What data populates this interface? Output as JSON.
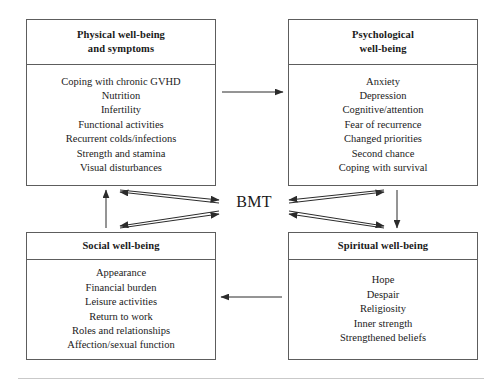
{
  "figure": {
    "hub_label": "BMT",
    "boxes": [
      {
        "id": "physical",
        "title_line1": "Physical well-being",
        "title_line2": "and symptoms",
        "items": [
          "Coping with chronic GVHD",
          "Nutrition",
          "Infertility",
          "Functional activities",
          "Recurrent colds/infections",
          "Strength and stamina",
          "Visual disturbances"
        ]
      },
      {
        "id": "psychological",
        "title_line1": "Psychological",
        "title_line2": "well-being",
        "items": [
          "Anxiety",
          "Depression",
          "Cognitive/attention",
          "Fear of recurrence",
          "Changed priorities",
          "Second chance",
          "Coping with survival"
        ]
      },
      {
        "id": "social",
        "title_line1": "Social well-being",
        "items": [
          "Appearance",
          "Financial burden",
          "Leisure activities",
          "Return to work",
          "Roles and relationships",
          "Affection/sexual function"
        ]
      },
      {
        "id": "spiritual",
        "title_line1": "Spiritual well-being",
        "items": [
          "Hope",
          "Despair",
          "Religiosity",
          "Inner strength",
          "Strengthened beliefs"
        ]
      }
    ],
    "colors": {
      "box_border": "#5d5d5d",
      "arrow": "#2b2b2b",
      "text": "#1a1a1a",
      "rule": "#c9c9c9",
      "background": "#ffffff"
    }
  }
}
